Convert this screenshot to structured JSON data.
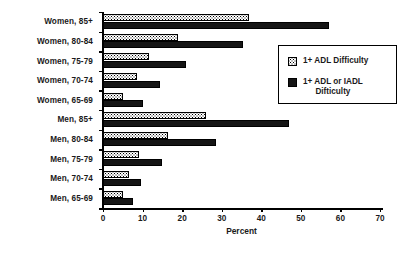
{
  "chart_data": {
    "type": "bar",
    "orientation": "horizontal",
    "title": "",
    "xlabel": "Percent",
    "ylabel": "",
    "xlim": [
      0,
      70
    ],
    "xticks": [
      0,
      10,
      20,
      30,
      40,
      50,
      60,
      70
    ],
    "xtick_labels": [
      "0",
      "10",
      "20",
      "30",
      "40",
      "50",
      "60",
      "70"
    ],
    "grid": false,
    "legend_position": "right",
    "categories": [
      "Women, 85+",
      "Women, 80-84",
      "Women, 75-79",
      "Women, 70-74",
      "Women, 65-69",
      "Men, 85+",
      "Men, 80-84",
      "Men, 75-79",
      "Men, 70-74",
      "Men, 65-69"
    ],
    "series": [
      {
        "name": "1+ ADL Difficulty",
        "key": "adl",
        "values": [
          37,
          19,
          11.5,
          8.7,
          5,
          26,
          16.5,
          9,
          6.5,
          5
        ]
      },
      {
        "name": "1+ ADL or IADL\nDifticulty",
        "key": "adliadl",
        "values": [
          57,
          35.4,
          21,
          14.5,
          10,
          47,
          28.5,
          15,
          9.5,
          7.5
        ]
      }
    ]
  },
  "legend": {
    "items": [
      {
        "label": "1+ ADL Difficulty",
        "swatch": "dotted-pattern-swatch"
      },
      {
        "label": "1+ ADL or IADL\nDifticulty",
        "swatch": "solid-black-swatch"
      }
    ]
  }
}
